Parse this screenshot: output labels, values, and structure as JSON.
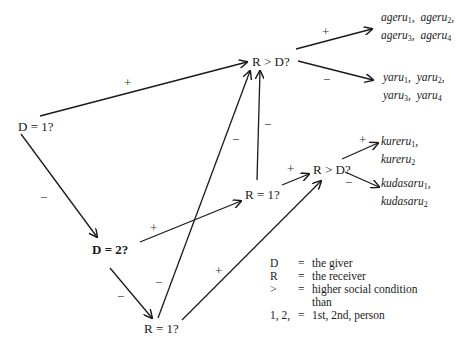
{
  "diagram": {
    "nodes": {
      "d1": "D = 1?",
      "d2": "D = 2?",
      "r_gt_d_top": "R > D?",
      "r1_mid": "R = 1?",
      "r_gt_d_right": "R > D?",
      "r1_bottom": "R = 1?"
    },
    "edge_signs": {
      "d1_to_rgtd_top": "+",
      "d1_to_d2": "−",
      "d2_to_r1mid": "+",
      "d2_to_r1bottom": "−",
      "r1mid_to_rgtd_top": "−",
      "r1bottom_to_rgtd_top": "−",
      "r1mid_to_rgtd_right": "+",
      "r1bottom_to_rgtd_right": "+",
      "rgtd_top_plus": "+",
      "rgtd_top_minus": "−",
      "rgtd_right_plus": "+",
      "rgtd_right_minus": "−"
    },
    "leaves": {
      "ageru": {
        "line1": [
          {
            "base": "ageru",
            "sub": "1"
          },
          {
            "base": "ageru",
            "sub": "2"
          }
        ],
        "line2": [
          {
            "base": "ageru",
            "sub": "3"
          },
          {
            "base": "ageru",
            "sub": "4"
          }
        ]
      },
      "yaru": {
        "line1": [
          {
            "base": "yaru",
            "sub": "1"
          },
          {
            "base": "yaru",
            "sub": "2"
          }
        ],
        "line2": [
          {
            "base": "yaru",
            "sub": "3"
          },
          {
            "base": "yaru",
            "sub": "4"
          }
        ]
      },
      "kureru": {
        "line1": [
          {
            "base": "kureru",
            "sub": "1"
          }
        ],
        "line2": [
          {
            "base": "kureru",
            "sub": "2"
          }
        ]
      },
      "kudasaru": {
        "line1": [
          {
            "base": "kudasaru",
            "sub": "1"
          }
        ],
        "line2": [
          {
            "base": "kudasaru",
            "sub": "2"
          }
        ]
      }
    },
    "legend": [
      {
        "key": "D",
        "eq": "=",
        "value": "the giver"
      },
      {
        "key": "R",
        "eq": "=",
        "value": "the receiver"
      },
      {
        "key": ">",
        "eq": "=",
        "value": "higher social condition"
      },
      {
        "key": "",
        "eq": "",
        "value": "than"
      },
      {
        "key": "1, 2,",
        "eq": "=",
        "value": "1st, 2nd, person"
      }
    ],
    "colors": {
      "line": "#1a1a1a",
      "background": "#ffffff"
    }
  }
}
